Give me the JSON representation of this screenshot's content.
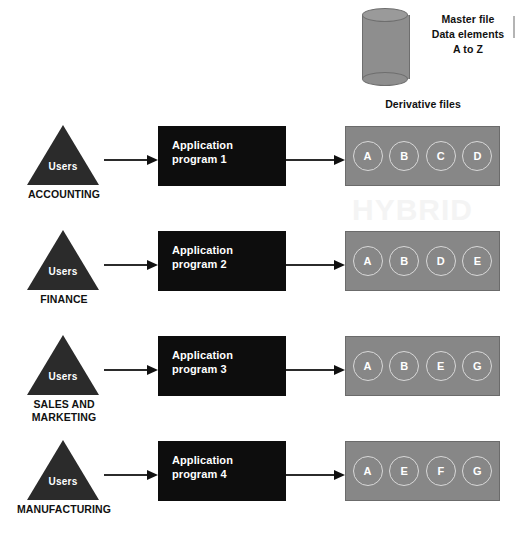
{
  "diagram": {
    "master": {
      "icon": "database-cylinder-icon",
      "caption_lines": [
        "Master file",
        "Data elements",
        "A to Z"
      ]
    },
    "derivative_header": "Derivative files",
    "watermark": "HYBRID",
    "rows": [
      {
        "department": "ACCOUNTING",
        "users_label": "Users",
        "program_lines": [
          "Application",
          "program 1"
        ],
        "elements": [
          "A",
          "B",
          "C",
          "D"
        ]
      },
      {
        "department": "FINANCE",
        "users_label": "Users",
        "program_lines": [
          "Application",
          "program 2"
        ],
        "elements": [
          "A",
          "B",
          "D",
          "E"
        ]
      },
      {
        "department": "SALES AND MARKETING",
        "users_label": "Users",
        "program_lines": [
          "Application",
          "program 3"
        ],
        "elements": [
          "A",
          "B",
          "E",
          "G"
        ]
      },
      {
        "department": "MANUFACTURING",
        "users_label": "Users",
        "program_lines": [
          "Application",
          "program 4"
        ],
        "elements": [
          "A",
          "E",
          "F",
          "G"
        ]
      }
    ]
  },
  "colors": {
    "program_box": "#0d0d0d",
    "derivative_box": "#878787",
    "triangle": "#2b2b2b",
    "cylinder": "#8e8e8e",
    "text_dark": "#111111",
    "text_light": "#ffffff"
  }
}
